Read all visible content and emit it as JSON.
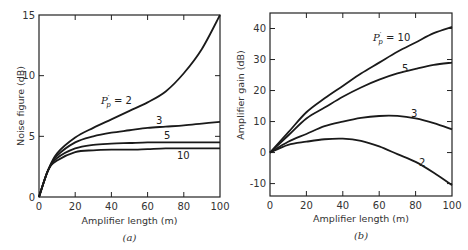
{
  "chart_data": [
    {
      "type": "line",
      "panel": "(a)",
      "title": "",
      "xlabel": "Amplifier length (m)",
      "ylabel": "Noise figure (dB)",
      "xlim": [
        0,
        100
      ],
      "ylim": [
        0,
        15
      ],
      "xticks": [
        0,
        20,
        40,
        60,
        80,
        100
      ],
      "yticks": [
        0,
        5,
        10,
        15
      ],
      "grid": false,
      "legend_position": "inline curve labels",
      "series": [
        {
          "name": "P'p = 2",
          "label": "P'p = 2",
          "x": [
            0,
            5,
            10,
            20,
            30,
            40,
            50,
            60,
            70,
            80,
            90,
            100
          ],
          "values": [
            0,
            2.2,
            3.6,
            4.9,
            5.7,
            6.4,
            7.1,
            7.8,
            8.7,
            10.2,
            12.2,
            15.0
          ]
        },
        {
          "name": "P'p = 3",
          "label": "3",
          "x": [
            0,
            5,
            10,
            20,
            30,
            40,
            50,
            60,
            70,
            80,
            90,
            100
          ],
          "values": [
            0,
            2.2,
            3.4,
            4.5,
            5.0,
            5.3,
            5.5,
            5.7,
            5.8,
            5.9,
            6.05,
            6.2
          ]
        },
        {
          "name": "P'p = 5",
          "label": "5",
          "x": [
            0,
            5,
            10,
            20,
            30,
            40,
            50,
            60,
            70,
            80,
            90,
            100
          ],
          "values": [
            0,
            2.2,
            3.2,
            4.0,
            4.3,
            4.4,
            4.45,
            4.5,
            4.5,
            4.5,
            4.5,
            4.5
          ]
        },
        {
          "name": "P'p = 10",
          "label": "10",
          "x": [
            0,
            5,
            10,
            20,
            30,
            40,
            50,
            60,
            70,
            80,
            90,
            100
          ],
          "values": [
            0,
            2.2,
            3.0,
            3.7,
            3.85,
            3.9,
            3.9,
            3.95,
            4.0,
            4.0,
            4.0,
            4.0
          ]
        }
      ],
      "caption": "(a)"
    },
    {
      "type": "line",
      "panel": "(b)",
      "title": "",
      "xlabel": "Amplifier length (m)",
      "ylabel": "Amplifier gain (dB)",
      "xlim": [
        0,
        100
      ],
      "ylim": [
        -14,
        45
      ],
      "xticks": [
        0,
        20,
        40,
        60,
        80,
        100
      ],
      "yticks": [
        -10,
        0,
        10,
        20,
        30,
        40
      ],
      "grid": false,
      "legend_position": "inline curve labels",
      "series": [
        {
          "name": "P'p = 10",
          "label": "P'p = 10",
          "x": [
            0,
            10,
            20,
            30,
            40,
            50,
            60,
            70,
            80,
            90,
            100
          ],
          "values": [
            0,
            6.5,
            13,
            17.5,
            21.5,
            25.5,
            29,
            32.5,
            35.5,
            38.5,
            40.5
          ]
        },
        {
          "name": "P'p = 5",
          "label": "5",
          "x": [
            0,
            10,
            20,
            30,
            40,
            50,
            60,
            70,
            80,
            90,
            100
          ],
          "values": [
            0,
            5.5,
            11,
            14.5,
            18,
            21,
            23.5,
            25.5,
            27,
            28.3,
            29
          ]
        },
        {
          "name": "P'p = 3",
          "label": "3",
          "x": [
            0,
            10,
            20,
            30,
            40,
            50,
            60,
            70,
            80,
            90,
            100
          ],
          "values": [
            0,
            3.5,
            6,
            8.5,
            10,
            11.2,
            11.8,
            11.8,
            11,
            9.5,
            7.5
          ]
        },
        {
          "name": "P'p = 2",
          "label": "2",
          "x": [
            0,
            10,
            20,
            30,
            40,
            50,
            60,
            70,
            80,
            90,
            100
          ],
          "values": [
            0,
            2.5,
            3.5,
            4.3,
            4.5,
            3.8,
            2,
            -0.5,
            -3,
            -6.5,
            -10.5
          ]
        }
      ],
      "caption": "(b)"
    }
  ],
  "panels": {
    "a": {
      "ylabel": "Noise figure (dB)",
      "xlabel": "Amplifier length (m)",
      "caption": "(a)",
      "curve_labels": {
        "p2_prefix": "P",
        "p2_sub": "p",
        "p2_suffix": " = 2",
        "p3": "3",
        "p5": "5",
        "p10": "10"
      }
    },
    "b": {
      "ylabel": "Amplifier gain (dB)",
      "xlabel": "Amplifier length (m)",
      "caption": "(b)",
      "curve_labels": {
        "p10_prefix": "P",
        "p10_sub": "p",
        "p10_suffix": " = 10",
        "p5": "5",
        "p3": "3",
        "p2": "2"
      }
    }
  }
}
